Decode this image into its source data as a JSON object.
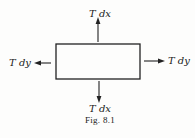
{
  "figure": {
    "caption": "Fig. 8.1",
    "element": {
      "shape": "rectangle"
    },
    "forces": {
      "top": {
        "label": "T dx",
        "direction": "up"
      },
      "bottom": {
        "label": "T dx",
        "direction": "down"
      },
      "left": {
        "label": "T dy",
        "direction": "left"
      },
      "right": {
        "label": "T dy",
        "direction": "right"
      }
    }
  }
}
